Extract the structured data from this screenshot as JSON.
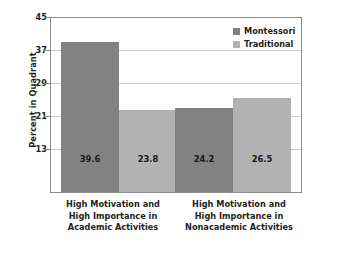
{
  "chart_data": {
    "type": "bar",
    "title": "",
    "xlabel": "",
    "ylabel": "Percent in Quadrant",
    "ylim": [
      5,
      45
    ],
    "yticks": [
      45,
      37,
      29,
      21,
      13
    ],
    "grid": true,
    "legend_position": "top-right",
    "categories": [
      "High Motivation and High Importance in Academic Activities",
      "High Motivation and High Importance in Nonacademic Activities"
    ],
    "category_lines": [
      [
        "High Motivation and",
        "High Importance in",
        "Academic Activities"
      ],
      [
        "High Motivation and",
        "High Importance in",
        "Nonacademic Activities"
      ]
    ],
    "series": [
      {
        "name": "Montessori",
        "color": "#828282",
        "values": [
          39.6,
          24.2
        ]
      },
      {
        "name": "Traditional",
        "color": "#b2b2b2",
        "values": [
          23.8,
          26.5
        ]
      }
    ],
    "value_labels": [
      "39.6",
      "23.8",
      "24.2",
      "26.5"
    ],
    "tick_labels": [
      "45",
      "37",
      "29",
      "21",
      "13"
    ]
  },
  "legend": {
    "items": [
      {
        "label": "Montessori"
      },
      {
        "label": "Traditional"
      }
    ]
  },
  "axes": {
    "y_title": "Percent in Quadrant"
  }
}
